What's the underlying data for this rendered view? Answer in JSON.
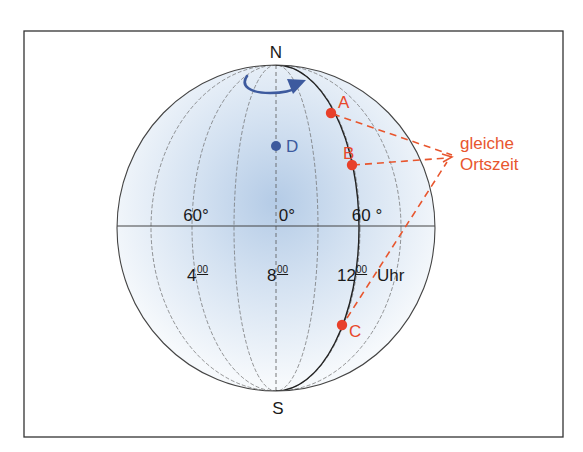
{
  "figure": {
    "pole_labels": {
      "north": "N",
      "south": "S"
    },
    "longitude_labels": [
      {
        "text": "60°",
        "position": "left"
      },
      {
        "text": "0°",
        "position": "center"
      },
      {
        "text": "60 °",
        "position": "right"
      }
    ],
    "time_labels": [
      {
        "hour": "4",
        "minutes": "00"
      },
      {
        "hour": "8",
        "minutes": "00"
      },
      {
        "hour": "12",
        "minutes": "00",
        "suffix": "Uhr"
      }
    ],
    "points": [
      {
        "id": "A",
        "label": "A",
        "color": "#e8472a"
      },
      {
        "id": "B",
        "label": "B",
        "color": "#e8472a"
      },
      {
        "id": "C",
        "label": "C",
        "color": "#e8472a"
      },
      {
        "id": "D",
        "label": "D",
        "color": "#3d5a9e"
      }
    ],
    "annotation": {
      "line1": "gleiche",
      "line2": "Ortszeit",
      "color": "#e8562e"
    },
    "rotation_arrow": {
      "color": "#3d5a9e"
    },
    "colors": {
      "frame": "#333333",
      "globe_outline": "#444444",
      "meridian": "#666666",
      "highlight_meridian": "#222222",
      "globe_fill_center": "#b8cfe8",
      "globe_fill_edge": "#f4f8fc"
    }
  }
}
